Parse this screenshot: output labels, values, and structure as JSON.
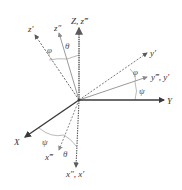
{
  "diagram": {
    "origin": {
      "x": 79,
      "y": 100
    },
    "colors": {
      "primary_axis": "#3a3a3a",
      "secondary_axis": "#8a8a8a",
      "dashed_axis": "#6a6a6a",
      "arc": "#a0a0a0",
      "text": "#333333"
    },
    "axes": [
      {
        "id": "Z",
        "label": "Z, z‴",
        "style": "solid-dark-gray",
        "end": {
          "x": 79,
          "y": 28
        },
        "label_pos": {
          "x": 71,
          "y": 24
        }
      },
      {
        "id": "z2",
        "label": "z″",
        "style": "solid-light",
        "end": {
          "x": 59,
          "y": 33
        },
        "label_pos": {
          "x": 54,
          "y": 30
        }
      },
      {
        "id": "z1",
        "label": "z′",
        "style": "dashed",
        "end": {
          "x": 35,
          "y": 35
        },
        "label_pos": {
          "x": 28,
          "y": 31
        }
      },
      {
        "id": "y1",
        "label": "y′",
        "style": "dashed",
        "end": {
          "x": 147,
          "y": 53
        },
        "label_pos": {
          "x": 150,
          "y": 56
        }
      },
      {
        "id": "y3",
        "label": "y‴, y′",
        "style": "solid-light",
        "end": {
          "x": 147,
          "y": 77
        },
        "label_pos": {
          "x": 151,
          "y": 80
        }
      },
      {
        "id": "Y",
        "label": "Y",
        "style": "solid-dark",
        "end": {
          "x": 164,
          "y": 100
        },
        "label_pos": {
          "x": 167,
          "y": 104
        }
      },
      {
        "id": "X",
        "label": "X",
        "style": "solid-dark",
        "end": {
          "x": 25,
          "y": 137
        },
        "label_pos": {
          "x": 14,
          "y": 145
        }
      },
      {
        "id": "x3",
        "label": "x‴",
        "style": "dashed",
        "end": {
          "x": 59,
          "y": 150
        },
        "label_pos": {
          "x": 45,
          "y": 160
        }
      },
      {
        "id": "x2",
        "label": "x″, x′",
        "style": "dashed-dark",
        "end": {
          "x": 76,
          "y": 167
        },
        "label_pos": {
          "x": 66,
          "y": 177
        }
      }
    ],
    "angles": [
      {
        "symbol": "φ",
        "between": [
          "z′",
          "z″"
        ],
        "pos": {
          "x": 47,
          "y": 53
        }
      },
      {
        "symbol": "θ",
        "between": [
          "z″",
          "Z"
        ],
        "pos": {
          "x": 65,
          "y": 49
        }
      },
      {
        "symbol": "φ",
        "between": [
          "y′",
          "y‴"
        ],
        "pos": {
          "x": 133,
          "y": 75
        }
      },
      {
        "symbol": "ψ",
        "between": [
          "y‴",
          "Y"
        ],
        "pos": {
          "x": 139,
          "y": 94
        }
      },
      {
        "symbol": "ψ",
        "between": [
          "X",
          "x‴"
        ],
        "pos": {
          "x": 42,
          "y": 145
        }
      },
      {
        "symbol": "θ",
        "between": [
          "x‴",
          "x″"
        ],
        "pos": {
          "x": 63,
          "y": 157
        }
      }
    ]
  }
}
